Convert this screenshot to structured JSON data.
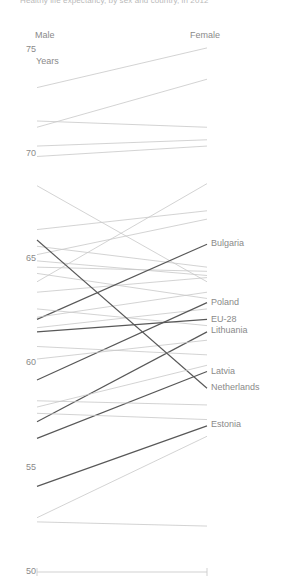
{
  "title": "Healthy life expectancy, by sex and country, in 2012",
  "axis": {
    "column_headers": [
      {
        "key": "male",
        "label": "Male"
      },
      {
        "key": "female",
        "label": "Female"
      }
    ],
    "units_label": "Years",
    "yticks": [
      75,
      70,
      65,
      60,
      55,
      50
    ],
    "ylim": [
      50,
      75
    ],
    "ylabel": "Years",
    "grid": false
  },
  "colors": {
    "background": "#ffffff",
    "text": "#8a8a8a",
    "title": "#b9b9b9",
    "line_default": "#c8c8c8",
    "line_highlight": "#585858",
    "axis": "#cccccc"
  },
  "labels": {
    "right": [
      "Bulgaria",
      "Poland",
      "EU-28",
      "Lithuania",
      "Latvia",
      "Netherlands",
      "Estonia"
    ]
  },
  "chart_data": {
    "type": "line",
    "chart_style": "slope",
    "title": "Healthy life expectancy, by sex and country, in 2012",
    "xlabel": "",
    "ylabel": "Years",
    "ylim": [
      50,
      75
    ],
    "x": [
      "Male",
      "Female"
    ],
    "legend_position": "right-labels",
    "series": [
      {
        "name": "unlabeled-01",
        "highlight": false,
        "values": [
          73.2,
          75.1
        ]
      },
      {
        "name": "unlabeled-02",
        "highlight": false,
        "values": [
          71.6,
          71.3
        ]
      },
      {
        "name": "unlabeled-03",
        "highlight": false,
        "values": [
          71.3,
          73.6
        ]
      },
      {
        "name": "unlabeled-04",
        "highlight": false,
        "values": [
          70.4,
          70.7
        ]
      },
      {
        "name": "unlabeled-05",
        "highlight": false,
        "values": [
          69.9,
          70.4
        ]
      },
      {
        "name": "unlabeled-06",
        "highlight": false,
        "values": [
          68.5,
          63.9
        ]
      },
      {
        "name": "unlabeled-07",
        "highlight": false,
        "values": [
          66.4,
          67.3
        ]
      },
      {
        "name": "unlabeled-08",
        "highlight": false,
        "values": [
          63.9,
          68.6
        ]
      },
      {
        "name": "unlabeled-09",
        "highlight": false,
        "values": [
          65.6,
          64.6
        ]
      },
      {
        "name": "unlabeled-10",
        "highlight": false,
        "values": [
          65.2,
          66.9
        ]
      },
      {
        "name": "unlabeled-11",
        "highlight": false,
        "values": [
          64.9,
          64.2
        ]
      },
      {
        "name": "unlabeled-12",
        "highlight": false,
        "values": [
          64.6,
          64.4
        ]
      },
      {
        "name": "unlabeled-13",
        "highlight": false,
        "values": [
          64.3,
          63.1
        ]
      },
      {
        "name": "unlabeled-14",
        "highlight": false,
        "values": [
          63.4,
          64.1
        ]
      },
      {
        "name": "Bulgaria",
        "highlight": true,
        "values": [
          62.1,
          65.7
        ]
      },
      {
        "name": "unlabeled-15",
        "highlight": false,
        "values": [
          62.6,
          61.8
        ]
      },
      {
        "name": "unlabeled-16",
        "highlight": false,
        "values": [
          62.2,
          63.4
        ]
      },
      {
        "name": "unlabeled-17",
        "highlight": false,
        "values": [
          61.7,
          62.6
        ]
      },
      {
        "name": "Poland",
        "highlight": true,
        "values": [
          59.2,
          62.9
        ]
      },
      {
        "name": "EU-28",
        "highlight": true,
        "values": [
          61.5,
          62.1
        ]
      },
      {
        "name": "Lithuania",
        "highlight": true,
        "values": [
          57.2,
          61.5
        ]
      },
      {
        "name": "unlabeled-18",
        "highlight": false,
        "values": [
          60.8,
          60.4
        ]
      },
      {
        "name": "unlabeled-19",
        "highlight": false,
        "values": [
          60.2,
          61.1
        ]
      },
      {
        "name": "Latvia",
        "highlight": true,
        "values": [
          56.4,
          59.6
        ]
      },
      {
        "name": "Netherlands",
        "highlight": true,
        "values": [
          65.9,
          58.8
        ]
      },
      {
        "name": "unlabeled-20",
        "highlight": false,
        "values": [
          58.2,
          58.0
        ]
      },
      {
        "name": "unlabeled-21",
        "highlight": false,
        "values": [
          57.9,
          59.9
        ]
      },
      {
        "name": "unlabeled-22",
        "highlight": false,
        "values": [
          57.6,
          57.3
        ]
      },
      {
        "name": "Estonia",
        "highlight": true,
        "values": [
          54.1,
          57.0
        ]
      },
      {
        "name": "unlabeled-23",
        "highlight": false,
        "values": [
          52.6,
          56.5
        ]
      },
      {
        "name": "unlabeled-24",
        "highlight": false,
        "values": [
          52.4,
          52.2
        ]
      }
    ]
  },
  "geometry": {
    "x_male_px": 37,
    "x_female_px": 207,
    "y_top_value": 75,
    "y_top_px": 50,
    "y_bottom_value": 50,
    "y_bottom_px": 572,
    "label_y_px": {
      "Bulgaria": 244,
      "Poland": 303,
      "EU-28": 320,
      "Lithuania": 331,
      "Latvia": 372,
      "Netherlands": 388,
      "Estonia": 425
    }
  }
}
